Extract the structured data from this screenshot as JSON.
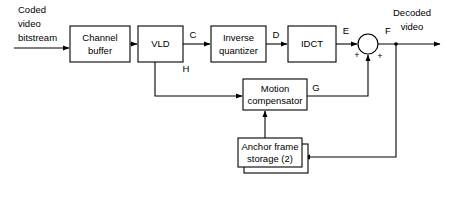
{
  "diagram": {
    "colors": {
      "background": "#ffffff",
      "stroke": "#000000",
      "box_fill": "#ffffff"
    },
    "input_label": {
      "line1": "Coded",
      "line2": "video",
      "line3": "bitstream"
    },
    "output_label": {
      "line1": "Decoded",
      "line2": "video"
    },
    "blocks": [
      {
        "id": "channel-buffer",
        "line1": "Channel",
        "line2": "buffer",
        "x": 70,
        "y": 26,
        "w": 60,
        "h": 36,
        "stacked": false
      },
      {
        "id": "vld",
        "line1": "VLD",
        "line2": "",
        "x": 138,
        "y": 26,
        "w": 45,
        "h": 36,
        "stacked": false
      },
      {
        "id": "inverse-quantizer",
        "line1": "Inverse",
        "line2": "quantizer",
        "x": 211,
        "y": 26,
        "w": 55,
        "h": 36,
        "stacked": false
      },
      {
        "id": "idct",
        "line1": "IDCT",
        "line2": "",
        "x": 288,
        "y": 26,
        "w": 48,
        "h": 36,
        "stacked": false
      },
      {
        "id": "motion-compensator",
        "line1": "Motion",
        "line2": "compensator",
        "x": 243,
        "y": 79,
        "w": 64,
        "h": 31,
        "stacked": false
      },
      {
        "id": "anchor-frame-storage",
        "line1": "Anchor frame",
        "line2": "storage (2)",
        "x": 238,
        "y": 138,
        "w": 64,
        "h": 29,
        "stacked": true
      }
    ],
    "signal_labels": [
      {
        "id": "C",
        "text": "C",
        "x": 193,
        "y": 35
      },
      {
        "id": "D",
        "text": "D",
        "x": 276,
        "y": 35
      },
      {
        "id": "E",
        "text": "E",
        "x": 346,
        "y": 31
      },
      {
        "id": "F",
        "text": "F",
        "x": 388,
        "y": 31
      },
      {
        "id": "G",
        "text": "G",
        "x": 316,
        "y": 88
      },
      {
        "id": "H",
        "text": "H",
        "x": 186,
        "y": 69
      }
    ],
    "summing_junction": {
      "id": "summing-junction",
      "cx": 368,
      "cy": 44,
      "r": 10,
      "plus_left": "+",
      "plus_right": "+"
    },
    "plus_positions": [
      {
        "x": 357,
        "y": 56
      },
      {
        "x": 380,
        "y": 57
      }
    ]
  }
}
